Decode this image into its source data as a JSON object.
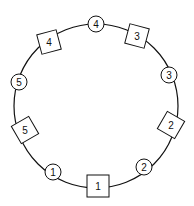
{
  "diagram": {
    "nodes": [
      {
        "id": "circle-4",
        "shape": "circle",
        "label": "4"
      },
      {
        "id": "square-3",
        "shape": "square",
        "label": "3"
      },
      {
        "id": "circle-3",
        "shape": "circle",
        "label": "3"
      },
      {
        "id": "square-2",
        "shape": "square",
        "label": "2"
      },
      {
        "id": "circle-2",
        "shape": "circle",
        "label": "2"
      },
      {
        "id": "square-1",
        "shape": "square",
        "label": "1"
      },
      {
        "id": "circle-1",
        "shape": "circle",
        "label": "1"
      },
      {
        "id": "square-5",
        "shape": "square",
        "label": "5"
      },
      {
        "id": "circle-5",
        "shape": "circle",
        "label": "5"
      },
      {
        "id": "square-4",
        "shape": "square",
        "label": "4"
      }
    ],
    "stroke_color": "#111111",
    "background_color": "#ffffff"
  }
}
